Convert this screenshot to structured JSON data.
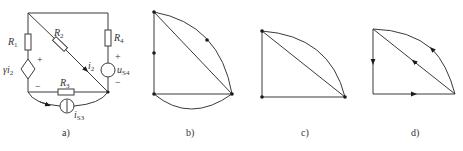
{
  "figure": {
    "panels": [
      {
        "id": "a",
        "caption": "a)",
        "type": "circuit",
        "components": {
          "R1": {
            "label": "R",
            "sub": "1"
          },
          "R2": {
            "label": "R",
            "sub": "2"
          },
          "R3": {
            "label": "R",
            "sub": "3"
          },
          "R4": {
            "label": "R",
            "sub": "4"
          },
          "dep_source": {
            "label": "γi",
            "sub": "2"
          },
          "current_i2": {
            "label": "i",
            "sub": "2"
          },
          "us4": {
            "label": "u",
            "sub": "S4"
          },
          "is3": {
            "label": "i",
            "sub": "S3"
          }
        },
        "signs": {
          "plus": "+",
          "minus": "−"
        }
      },
      {
        "id": "b",
        "caption": "b)",
        "type": "graph",
        "description": "graph with 6 nodes"
      },
      {
        "id": "c",
        "caption": "c)",
        "type": "graph",
        "description": "reduced graph with 3 nodes"
      },
      {
        "id": "d",
        "caption": "d)",
        "type": "directed-graph",
        "description": "directed graph with 3 nodes"
      }
    ]
  }
}
